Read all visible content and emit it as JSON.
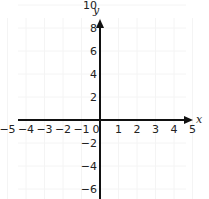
{
  "chart_data": {
    "type": "line",
    "title": "",
    "xlabel": "x",
    "ylabel": "y",
    "xlim": [
      -5,
      5
    ],
    "ylim": [
      -9,
      12
    ],
    "x_ticks": [
      "-5",
      "-4",
      "-3",
      "-2",
      "-1",
      "0",
      "1",
      "2",
      "3",
      "4",
      "5"
    ],
    "y_ticks": [
      "12",
      "10",
      "8",
      "6",
      "4",
      "2",
      "-2",
      "-4",
      "-6",
      "-8"
    ],
    "grid": true,
    "series": []
  }
}
